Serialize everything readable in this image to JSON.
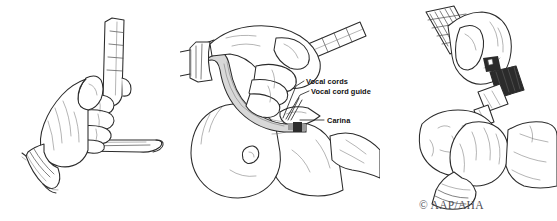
{
  "figure": {
    "background_color": "#ffffff",
    "ink_color": "#2b2b2b",
    "width": 557,
    "height": 221
  },
  "panels": [
    {
      "id": "panel-1",
      "name": "holding-laryngoscope",
      "caption": "Hand holding laryngoscope",
      "objects": [
        "gloved-hand",
        "laryngoscope-handle",
        "laryngoscope-blade",
        "glove-cuff"
      ]
    },
    {
      "id": "panel-2",
      "name": "inserting-tube",
      "caption": "Inserting endotracheal tube into infant airway",
      "objects": [
        "gloved-hand",
        "laryngoscope",
        "endotracheal-tube",
        "infant-head",
        "infant-torso",
        "infant-arm"
      ]
    },
    {
      "id": "panel-3",
      "name": "co2-detector",
      "caption": "Attaching CO2 detector and ventilation bag to tube",
      "objects": [
        "gloved-hands",
        "ventilation-bag-tube",
        "co2-detector",
        "tube-connector",
        "infant-face"
      ]
    }
  ],
  "callouts": [
    {
      "id": "vocal-cords",
      "label": "Vocal cords"
    },
    {
      "id": "vocal-cord-guide",
      "label": "Vocal cord guide"
    },
    {
      "id": "carina",
      "label": "Carina"
    }
  ],
  "credit": {
    "text": "© AAP/AHA",
    "color": "#4d4d55"
  }
}
